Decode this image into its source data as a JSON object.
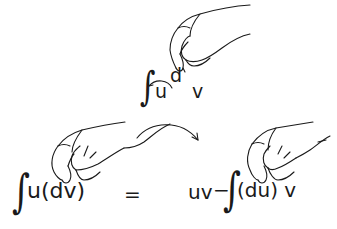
{
  "top_formula": {
    "integral_sign": "∫",
    "u": "u",
    "d": "d",
    "v": "v"
  },
  "bottom_formula": {
    "lhs_integral": "∫",
    "lhs_expr": "u(dv)",
    "equals": "=",
    "rhs_uv": "uv",
    "rhs_minus": "−",
    "rhs_integral": "∫",
    "rhs_expr": "(du) v"
  },
  "icons": {
    "top_hand": "hand-pinching-d-icon",
    "top_arrow": "curved-arrow-around-u-icon",
    "left_hand": "hand-pinching-dv-icon",
    "middle_arrow": "curved-arrow-right-icon",
    "right_hand": "hand-pinching-du-icon"
  },
  "colors": {
    "ink": "#1a1a1a",
    "background": "#ffffff"
  }
}
